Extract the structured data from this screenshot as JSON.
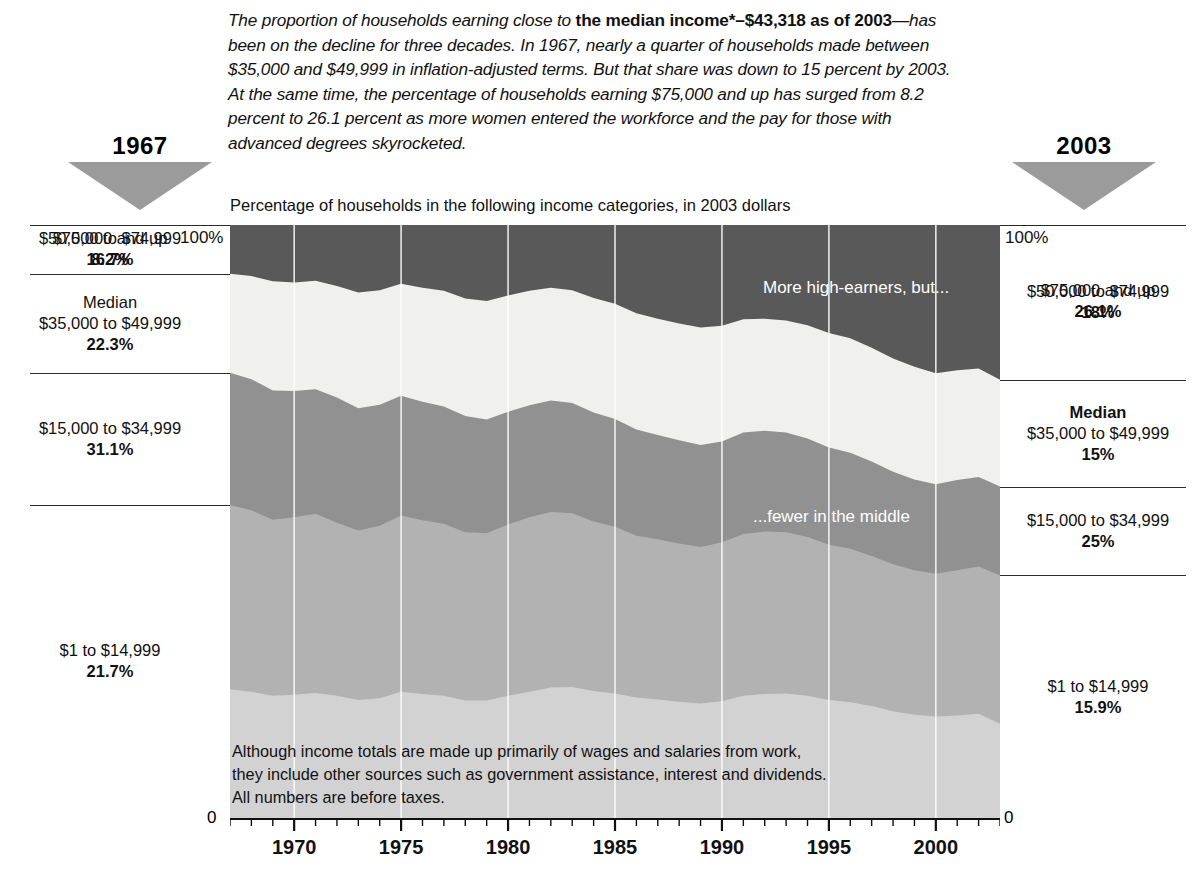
{
  "intro": {
    "before_bold": "The proportion of households earning close to ",
    "bold": "the median income*–$43,318 as of 2003",
    "after_bold": "—has been on the decline for three decades. In 1967, nearly a quarter of households made between $35,000 and $49,999 in inflation-adjusted terms. But that share was down to 15 percent by 2003. At the same time, the percentage of households earning $75,000 and up has surged from 8.2 percent to 26.1 percent as more women entered the workforce and the pay for those with advanced degrees skyrocketed."
  },
  "year_left": "1967",
  "year_right": "2003",
  "subtitle": "Percentage of households in the following income categories, in 2003 dollars",
  "pct_100_left": "100%",
  "pct_100_right": "100%",
  "zero_left": "0",
  "zero_right": "0",
  "notes": {
    "high_earners": "More high-earners, but...",
    "middle": "...fewer in the middle"
  },
  "footnote": "Although income totals are made up primarily of wages and salaries from work, they include other sources such as government assistance, interest and dividends. All numbers are before taxes.",
  "left_labels": [
    {
      "title": "",
      "range": "$75,000 and up",
      "pct": "8.2%"
    },
    {
      "title": "",
      "range": "$50,000 to $74,999",
      "pct": "16.7%"
    },
    {
      "title": "Median",
      "range": "$35,000 to $49,999",
      "pct": "22.3%"
    },
    {
      "title": "",
      "range": "$15,000 to $34,999",
      "pct": "31.1%"
    },
    {
      "title": "",
      "range": "$1 to $14,999",
      "pct": "21.7%"
    }
  ],
  "right_labels": [
    {
      "title": "",
      "range": "$75,000 and up",
      "pct": "26.1%"
    },
    {
      "title": "",
      "range": "$50,000 to $74,999",
      "pct": "18%"
    },
    {
      "title": "Median",
      "range": "$35,000 to $49,999",
      "pct": "15%"
    },
    {
      "title": "",
      "range": "$15,000 to $34,999",
      "pct": "25%"
    },
    {
      "title": "",
      "range": "$1 to $14,999",
      "pct": "15.9%"
    }
  ],
  "colors": {
    "band_75k_up": "#595959",
    "band_50_75": "#f0f0ee",
    "band_35_50": "#919191",
    "band_15_35": "#b2b2b2",
    "band_1_15": "#d2d2d2",
    "triangle": "#9b9b9b",
    "gridline": "#ffffff",
    "rule": "#2a2a2a"
  },
  "chart_data": {
    "type": "area",
    "title": "Percentage of households in the following income categories, in 2003 dollars",
    "xlabel": "",
    "ylabel": "",
    "ylim": [
      0,
      100
    ],
    "xlim": [
      1967,
      2003
    ],
    "stacked": true,
    "grid": true,
    "gridlines_x": [
      1970,
      1975,
      1980,
      1985,
      1990,
      1995,
      2000
    ],
    "xticks": [
      1970,
      1975,
      1980,
      1985,
      1990,
      1995,
      2000
    ],
    "xtick_labels": [
      "1970",
      "1975",
      "1980",
      "1985",
      "1990",
      "1995",
      "2000"
    ],
    "yticks": [
      0,
      100
    ],
    "ytick_labels": [
      "0",
      "100%"
    ],
    "legend_position": "outside-left-right",
    "x": [
      1967,
      1968,
      1969,
      1970,
      1971,
      1972,
      1973,
      1974,
      1975,
      1976,
      1977,
      1978,
      1979,
      1980,
      1981,
      1982,
      1983,
      1984,
      1985,
      1986,
      1987,
      1988,
      1989,
      1990,
      1991,
      1992,
      1993,
      1994,
      1995,
      1996,
      1997,
      1998,
      1999,
      2000,
      2001,
      2002,
      2003
    ],
    "series": [
      {
        "name": "$1 to $14,999",
        "color": "#d2d2d2",
        "values": [
          21.7,
          21.3,
          20.6,
          20.8,
          21.1,
          20.6,
          19.9,
          20.2,
          21.3,
          20.9,
          20.6,
          19.8,
          19.8,
          20.6,
          21.3,
          22.0,
          22.1,
          21.4,
          21.0,
          20.3,
          20.0,
          19.6,
          19.3,
          19.7,
          20.6,
          20.9,
          21.0,
          20.6,
          19.9,
          19.5,
          18.9,
          18.0,
          17.4,
          17.1,
          17.3,
          17.6,
          15.9
        ]
      },
      {
        "name": "$15,000 to $34,999",
        "color": "#b2b2b2",
        "values": [
          31.1,
          30.6,
          29.7,
          29.9,
          30.2,
          29.2,
          28.6,
          29.1,
          29.7,
          29.3,
          29.0,
          28.4,
          28.2,
          28.9,
          29.4,
          29.6,
          29.3,
          28.6,
          28.1,
          27.3,
          27.0,
          26.7,
          26.4,
          26.8,
          27.3,
          27.4,
          27.2,
          26.8,
          26.2,
          25.9,
          25.3,
          24.8,
          24.4,
          24.1,
          24.5,
          24.8,
          25.0
        ]
      },
      {
        "name": "$35,000 to $49,999",
        "color": "#919191",
        "values": [
          22.3,
          22.1,
          21.8,
          21.3,
          21.0,
          21.1,
          20.6,
          20.4,
          20.2,
          20.0,
          19.8,
          19.6,
          19.2,
          19.0,
          18.9,
          18.8,
          18.6,
          18.4,
          18.2,
          17.9,
          17.6,
          17.4,
          17.2,
          17.0,
          17.1,
          17.0,
          16.8,
          16.6,
          16.4,
          16.2,
          15.9,
          15.6,
          15.3,
          15.1,
          15.2,
          15.1,
          15.0
        ]
      },
      {
        "name": "$50,000 to $74,999",
        "color": "#f0f0ee",
        "values": [
          16.7,
          17.4,
          18.4,
          18.3,
          18.3,
          18.8,
          19.5,
          19.3,
          18.9,
          19.2,
          19.5,
          19.8,
          20.0,
          19.6,
          19.3,
          19.0,
          19.0,
          19.3,
          19.4,
          19.6,
          19.6,
          19.7,
          19.8,
          19.5,
          19.1,
          18.9,
          18.9,
          19.1,
          19.3,
          19.3,
          19.2,
          19.1,
          19.0,
          18.7,
          18.5,
          18.3,
          18.0
        ]
      },
      {
        "name": "$75,000 and up",
        "color": "#595959",
        "values": [
          8.2,
          8.6,
          9.5,
          9.7,
          9.4,
          10.3,
          11.4,
          11.0,
          9.9,
          10.6,
          11.1,
          12.4,
          12.8,
          11.9,
          11.1,
          10.6,
          11.0,
          12.3,
          13.3,
          14.9,
          15.8,
          16.6,
          17.3,
          17.0,
          15.9,
          15.8,
          16.1,
          16.9,
          18.2,
          19.1,
          20.7,
          22.5,
          23.9,
          25.0,
          24.5,
          24.2,
          26.1
        ]
      }
    ]
  }
}
